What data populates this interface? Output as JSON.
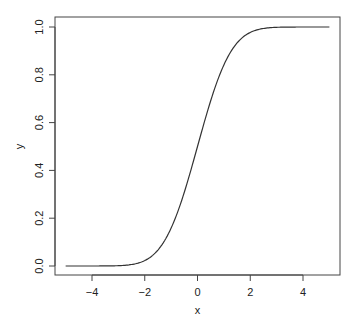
{
  "chart_data": {
    "type": "line",
    "title": "",
    "xlabel": "x",
    "ylabel": "y",
    "xlim": [
      -5,
      5
    ],
    "ylim": [
      0,
      1
    ],
    "grid": false,
    "legend": null,
    "x_ticks": [
      -4,
      -2,
      0,
      2,
      4
    ],
    "x_tick_labels": [
      "−4",
      "−2",
      "0",
      "2",
      "4"
    ],
    "y_ticks": [
      0.0,
      0.2,
      0.4,
      0.6,
      0.8,
      1.0
    ],
    "y_tick_labels": [
      "0.0",
      "0.2",
      "0.4",
      "0.6",
      "0.8",
      "1.0"
    ],
    "series": [
      {
        "name": "y",
        "description": "Standard normal CDF (S-shaped curve)",
        "color": "#333333",
        "x": [
          -5,
          -4.5,
          -4,
          -3.5,
          -3,
          -2.5,
          -2,
          -1.5,
          -1,
          -0.5,
          0,
          0.5,
          1,
          1.5,
          2,
          2.5,
          3,
          3.5,
          4,
          4.5,
          5
        ],
        "y": [
          0.0,
          0.0,
          0.0,
          0.0002,
          0.0013,
          0.0062,
          0.0228,
          0.0668,
          0.1587,
          0.3085,
          0.5,
          0.6915,
          0.8413,
          0.9332,
          0.9772,
          0.9938,
          0.9987,
          0.9998,
          1.0,
          1.0,
          1.0
        ]
      }
    ]
  },
  "colors": {
    "axis": "#444444",
    "line": "#333333",
    "background": "#ffffff"
  }
}
